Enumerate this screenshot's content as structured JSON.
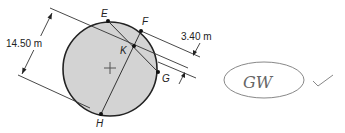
{
  "diagram": {
    "points": {
      "E": {
        "label": "E"
      },
      "F": {
        "label": "F"
      },
      "K": {
        "label": "K"
      },
      "G": {
        "label": "G"
      },
      "H": {
        "label": "H"
      }
    },
    "dimensions": {
      "diameter_span": "14.50 m",
      "parallel_gap": "3.40 m"
    },
    "center_marker": "+",
    "annotation": {
      "handwritten_initials": "GW",
      "check_mark": "check"
    },
    "colors": {
      "circle_fill": "#d3d3d3",
      "stroke": "#222222"
    }
  }
}
